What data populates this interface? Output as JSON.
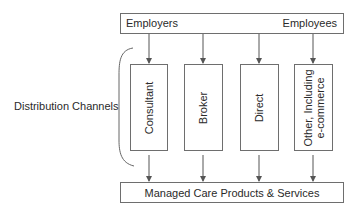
{
  "diagram": {
    "top_box": {
      "left_label": "Employers",
      "right_label": "Employees"
    },
    "side_label": "Distribution Channels",
    "channels": [
      {
        "label": "Consultant"
      },
      {
        "label": "Broker"
      },
      {
        "label": "Direct"
      },
      {
        "label_line1": "Other, Including",
        "label_line2": "e-commerce"
      }
    ],
    "bottom_box": {
      "label": "Managed Care Products & Services"
    },
    "colors": {
      "line": "#6e6e6e",
      "text": "#2a2a2a",
      "background": "#ffffff"
    }
  }
}
